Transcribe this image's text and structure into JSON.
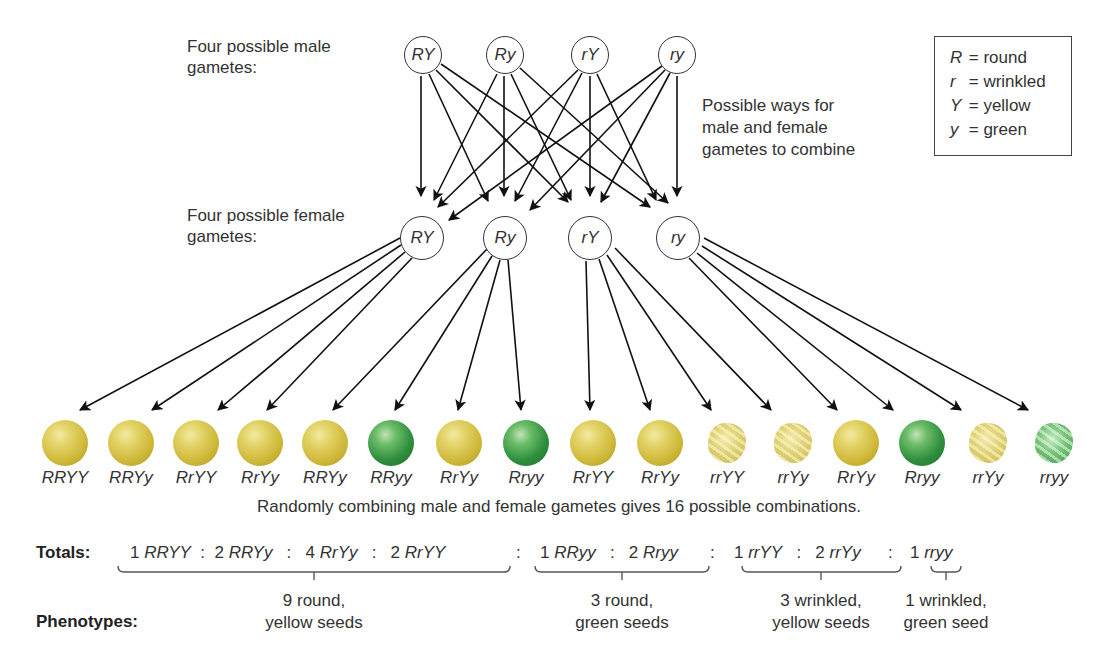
{
  "labels": {
    "male_gametes": [
      "Four possible male",
      "gametes:"
    ],
    "female_gametes": [
      "Four possible female",
      "gametes:"
    ],
    "combine_note": [
      "Possible ways for",
      "male and female",
      "gametes to combine"
    ],
    "caption": "Randomly combining male and female gametes gives 16 possible combinations.",
    "totals": "Totals:",
    "phenotypes": "Phenotypes:"
  },
  "legend": [
    {
      "symbol": "R",
      "meaning": "= round"
    },
    {
      "symbol": "r",
      "meaning": "= wrinkled"
    },
    {
      "symbol": "Y",
      "meaning": "= yellow"
    },
    {
      "symbol": "y",
      "meaning": "= green"
    }
  ],
  "male_gametes": [
    "RY",
    "Ry",
    "rY",
    "ry"
  ],
  "female_gametes": [
    "RY",
    "Ry",
    "rY",
    "ry"
  ],
  "offspring": [
    {
      "genotype": "RRYY",
      "color": "yellow",
      "shape": "round"
    },
    {
      "genotype": "RRYy",
      "color": "yellow",
      "shape": "round"
    },
    {
      "genotype": "RrYY",
      "color": "yellow",
      "shape": "round"
    },
    {
      "genotype": "RrYy",
      "color": "yellow",
      "shape": "round"
    },
    {
      "genotype": "RRYy",
      "color": "yellow",
      "shape": "round"
    },
    {
      "genotype": "RRyy",
      "color": "green",
      "shape": "round"
    },
    {
      "genotype": "RrYy",
      "color": "yellow",
      "shape": "round"
    },
    {
      "genotype": "Rryy",
      "color": "green",
      "shape": "round"
    },
    {
      "genotype": "RrYY",
      "color": "yellow",
      "shape": "round"
    },
    {
      "genotype": "RrYy",
      "color": "yellow",
      "shape": "round"
    },
    {
      "genotype": "rrYY",
      "color": "yellow",
      "shape": "wrinkled"
    },
    {
      "genotype": "rrYy",
      "color": "yellow",
      "shape": "wrinkled"
    },
    {
      "genotype": "RrYy",
      "color": "yellow",
      "shape": "round"
    },
    {
      "genotype": "Rryy",
      "color": "green",
      "shape": "round"
    },
    {
      "genotype": "rrYy",
      "color": "yellow",
      "shape": "wrinkled"
    },
    {
      "genotype": "rryy",
      "color": "green",
      "shape": "wrinkled"
    }
  ],
  "totals": {
    "group1": [
      {
        "count": "1",
        "genotype": "RRYY"
      },
      {
        "count": "2",
        "genotype": "RRYy"
      },
      {
        "count": "4",
        "genotype": "RrYy"
      },
      {
        "count": "2",
        "genotype": "RrYY"
      }
    ],
    "group2": [
      {
        "count": "1",
        "genotype": "RRyy"
      },
      {
        "count": "2",
        "genotype": "Rryy"
      }
    ],
    "group3": [
      {
        "count": "1",
        "genotype": "rrYY"
      },
      {
        "count": "2",
        "genotype": "rrYy"
      }
    ],
    "group4": [
      {
        "count": "1",
        "genotype": "rryy"
      }
    ],
    "separator": ":"
  },
  "phenotypes": [
    {
      "line1": "9 round,",
      "line2": "yellow seeds"
    },
    {
      "line1": "3 round,",
      "line2": "green seeds"
    },
    {
      "line1": "3 wrinkled,",
      "line2": "yellow seeds"
    },
    {
      "line1": "1 wrinkled,",
      "line2": "green seed"
    }
  ],
  "colors": {
    "yellow_seed": "#d4c04a",
    "green_seed": "#2f8f3e",
    "line": "#111111"
  }
}
